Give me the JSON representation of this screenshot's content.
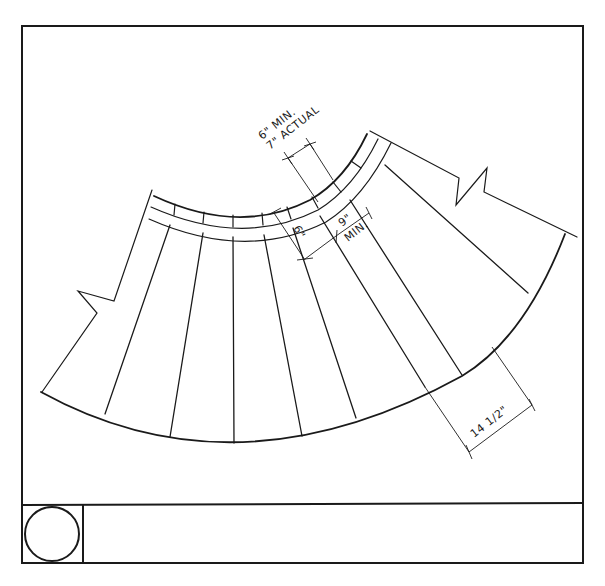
{
  "drawing": {
    "type": "curved stair plan",
    "colors": {
      "line": "#1a1a1a",
      "background": "#ffffff"
    },
    "dimensions": {
      "nosing_width_a": "6\" MIN.",
      "nosing_width_b": "7\" ACTUAL",
      "inner_depth": "6\"",
      "min_tread_a": "9\"",
      "min_tread_b": "MIN.",
      "outer_tread": "14 1/2\""
    }
  },
  "title_block": {
    "symbol": "circle-in-square",
    "label": ""
  }
}
